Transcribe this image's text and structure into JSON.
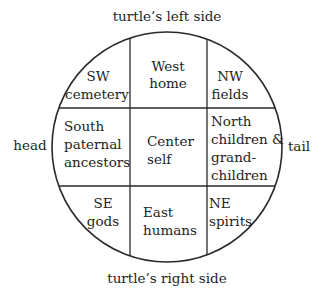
{
  "diagram": {
    "type": "cosmological-grid-on-turtle",
    "labels": {
      "top": "turtle’s left side",
      "bottom": "turtle’s right side",
      "left": "head",
      "right": "tail"
    },
    "cells": {
      "sw": {
        "lines": [
          "SW",
          "cemetery"
        ]
      },
      "west": {
        "lines": [
          "West",
          "home"
        ]
      },
      "nw": {
        "lines": [
          "NW",
          "fields"
        ]
      },
      "south": {
        "lines": [
          "South",
          "paternal",
          "ancestors"
        ]
      },
      "center": {
        "lines": [
          "Center",
          "self"
        ]
      },
      "north": {
        "lines": [
          "North",
          "children &",
          "grand-",
          "children"
        ]
      },
      "se": {
        "lines": [
          "SE",
          "gods"
        ]
      },
      "east": {
        "lines": [
          "East",
          "humans"
        ]
      },
      "ne": {
        "lines": [
          "NE",
          "spirits"
        ]
      }
    },
    "colors": {
      "stroke": "#2a2a2a",
      "text": "#1e1e1e",
      "background": "#ffffff"
    }
  }
}
